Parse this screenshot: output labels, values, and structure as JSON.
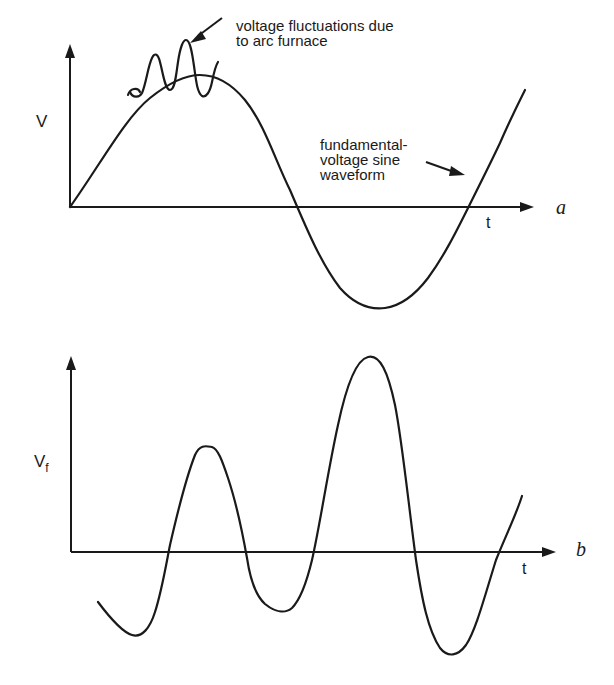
{
  "figure": {
    "panel_a": {
      "panel_label": "a",
      "y_axis_label": "V",
      "x_axis_label": "t",
      "annotation_fluctuations_line1": "voltage fluctuations due",
      "annotation_fluctuations_line2": "to arc furnace",
      "annotation_fundamental_line1": "fundamental-",
      "annotation_fundamental_line2": "voltage sine",
      "annotation_fundamental_line3": "waveform"
    },
    "panel_b": {
      "panel_label": "b",
      "y_axis_label_main": "V",
      "y_axis_label_sub": "f",
      "x_axis_label": "t"
    }
  },
  "colors": {
    "ink": "#1a1a1a",
    "background": "#ffffff"
  }
}
